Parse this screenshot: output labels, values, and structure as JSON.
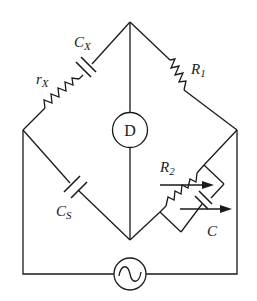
{
  "diagram": {
    "type": "AC bridge circuit (Schering-type capacitance bridge)",
    "background": "#ffffff",
    "line_color": "#1a1a1a",
    "nodes": {
      "top": [
        130,
        22
      ],
      "left": [
        23,
        130
      ],
      "right": [
        237,
        130
      ],
      "bottom": [
        130,
        240
      ]
    },
    "components": {
      "rx": {
        "kind": "resistor",
        "label_main": "r",
        "label_sub": "X",
        "branch": "top-left"
      },
      "cx": {
        "kind": "capacitor",
        "label_main": "C",
        "label_sub": "X",
        "branch": "top-left"
      },
      "r1": {
        "kind": "resistor",
        "label_main": "R",
        "label_sub": "1",
        "branch": "top-right"
      },
      "cs": {
        "kind": "capacitor",
        "label_main": "C",
        "label_sub": "S",
        "branch": "bottom-left"
      },
      "r2": {
        "kind": "variable-resistor",
        "label_main": "R",
        "label_sub": "2",
        "branch": "bottom-right"
      },
      "c": {
        "kind": "variable-capacitor",
        "label_main": "C",
        "label_sub": "",
        "branch": "bottom-right (parallel with R2)"
      },
      "detector": {
        "kind": "detector",
        "label": "D",
        "branch": "top-bottom diagonal"
      },
      "source": {
        "kind": "AC source",
        "symbol": "~",
        "branch": "left-right via bottom loop"
      }
    }
  }
}
